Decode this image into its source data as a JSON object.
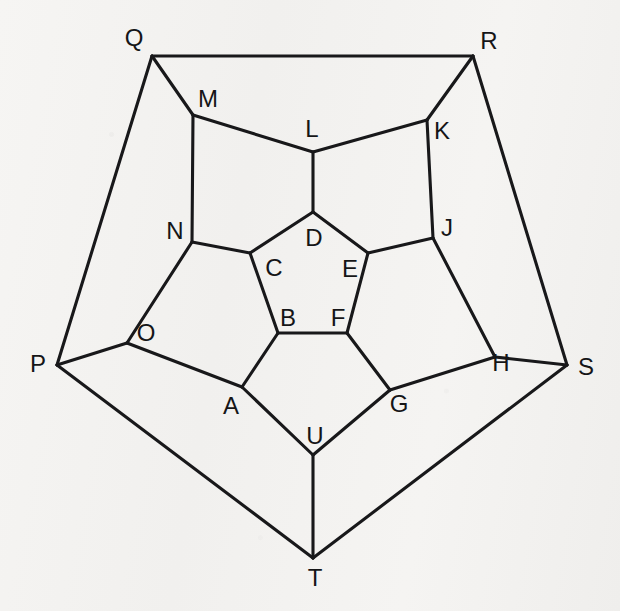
{
  "figure": {
    "kind": "graph-diagram",
    "name": "Dodecahedral graph (Schlegel diagram)",
    "background_color": "#f4f3f1",
    "line_color": "#18181a",
    "label_color": "#151517",
    "width": 620,
    "height": 611
  },
  "vertices": [
    {
      "id": "A",
      "label": "A",
      "x": 242,
      "y": 387,
      "label_x": 231,
      "label_y": 406,
      "ring": "middle"
    },
    {
      "id": "B",
      "label": "B",
      "x": 278,
      "y": 333,
      "label_x": 288,
      "label_y": 318,
      "ring": "inner"
    },
    {
      "id": "C",
      "label": "C",
      "x": 250,
      "y": 253,
      "label_x": 274,
      "label_y": 268,
      "ring": "inner"
    },
    {
      "id": "D",
      "label": "D",
      "x": 313,
      "y": 212,
      "label_x": 314,
      "label_y": 238,
      "ring": "inner"
    },
    {
      "id": "E",
      "label": "E",
      "x": 368,
      "y": 253,
      "label_x": 350,
      "label_y": 269,
      "ring": "inner"
    },
    {
      "id": "F",
      "label": "F",
      "x": 347,
      "y": 333,
      "label_x": 338,
      "label_y": 318,
      "ring": "inner"
    },
    {
      "id": "G",
      "label": "G",
      "x": 390,
      "y": 390,
      "label_x": 399,
      "label_y": 404,
      "ring": "middle"
    },
    {
      "id": "H",
      "label": "H",
      "x": 495,
      "y": 357,
      "label_x": 501,
      "label_y": 363,
      "ring": "middle"
    },
    {
      "id": "J",
      "label": "J",
      "x": 433,
      "y": 238,
      "label_x": 447,
      "label_y": 228,
      "ring": "middle"
    },
    {
      "id": "K",
      "label": "K",
      "x": 427,
      "y": 120,
      "label_x": 442,
      "label_y": 131,
      "ring": "middle"
    },
    {
      "id": "L",
      "label": "L",
      "x": 313,
      "y": 152,
      "label_x": 312,
      "label_y": 129,
      "ring": "middle"
    },
    {
      "id": "M",
      "label": "M",
      "x": 193,
      "y": 115,
      "label_x": 208,
      "label_y": 99,
      "ring": "middle"
    },
    {
      "id": "N",
      "label": "N",
      "x": 192,
      "y": 242,
      "label_x": 175,
      "label_y": 231,
      "ring": "middle"
    },
    {
      "id": "O",
      "label": "O",
      "x": 127,
      "y": 343,
      "label_x": 146,
      "label_y": 333,
      "ring": "middle"
    },
    {
      "id": "P",
      "label": "P",
      "x": 57,
      "y": 365,
      "label_x": 38,
      "label_y": 364,
      "ring": "outer"
    },
    {
      "id": "Q",
      "label": "Q",
      "x": 152,
      "y": 56,
      "label_x": 134,
      "label_y": 38,
      "ring": "outer"
    },
    {
      "id": "R",
      "label": "R",
      "x": 473,
      "y": 56,
      "label_x": 489,
      "label_y": 41,
      "ring": "outer"
    },
    {
      "id": "S",
      "label": "S",
      "x": 567,
      "y": 365,
      "label_x": 586,
      "label_y": 367,
      "ring": "outer"
    },
    {
      "id": "T",
      "label": "T",
      "x": 313,
      "y": 558,
      "label_x": 315,
      "label_y": 578,
      "ring": "outer"
    },
    {
      "id": "U",
      "label": "U",
      "x": 313,
      "y": 455,
      "label_x": 315,
      "label_y": 436,
      "ring": "middle"
    }
  ],
  "edges": [
    {
      "from": "B",
      "to": "C",
      "group": "inner-pentagon"
    },
    {
      "from": "C",
      "to": "D",
      "group": "inner-pentagon"
    },
    {
      "from": "D",
      "to": "E",
      "group": "inner-pentagon"
    },
    {
      "from": "E",
      "to": "F",
      "group": "inner-pentagon"
    },
    {
      "from": "F",
      "to": "B",
      "group": "inner-pentagon"
    },
    {
      "from": "B",
      "to": "A",
      "group": "inner-to-middle"
    },
    {
      "from": "C",
      "to": "N",
      "group": "inner-to-middle"
    },
    {
      "from": "D",
      "to": "L",
      "group": "inner-to-middle"
    },
    {
      "from": "E",
      "to": "J",
      "group": "inner-to-middle"
    },
    {
      "from": "F",
      "to": "G",
      "group": "inner-to-middle"
    },
    {
      "from": "A",
      "to": "O",
      "group": "middle-ring"
    },
    {
      "from": "O",
      "to": "N",
      "group": "middle-ring"
    },
    {
      "from": "N",
      "to": "M",
      "group": "middle-ring"
    },
    {
      "from": "M",
      "to": "L",
      "group": "middle-ring"
    },
    {
      "from": "L",
      "to": "K",
      "group": "middle-ring"
    },
    {
      "from": "K",
      "to": "J",
      "group": "middle-ring"
    },
    {
      "from": "J",
      "to": "H",
      "group": "middle-ring"
    },
    {
      "from": "H",
      "to": "G",
      "group": "middle-ring"
    },
    {
      "from": "G",
      "to": "U",
      "group": "middle-ring"
    },
    {
      "from": "U",
      "to": "A",
      "group": "middle-ring"
    },
    {
      "from": "O",
      "to": "P",
      "group": "middle-to-outer"
    },
    {
      "from": "M",
      "to": "Q",
      "group": "middle-to-outer"
    },
    {
      "from": "K",
      "to": "R",
      "group": "middle-to-outer"
    },
    {
      "from": "H",
      "to": "S",
      "group": "middle-to-outer"
    },
    {
      "from": "U",
      "to": "T",
      "group": "middle-to-outer"
    },
    {
      "from": "P",
      "to": "Q",
      "group": "outer-pentagon"
    },
    {
      "from": "Q",
      "to": "R",
      "group": "outer-pentagon"
    },
    {
      "from": "R",
      "to": "S",
      "group": "outer-pentagon"
    },
    {
      "from": "S",
      "to": "T",
      "group": "outer-pentagon"
    },
    {
      "from": "T",
      "to": "P",
      "group": "outer-pentagon"
    }
  ]
}
